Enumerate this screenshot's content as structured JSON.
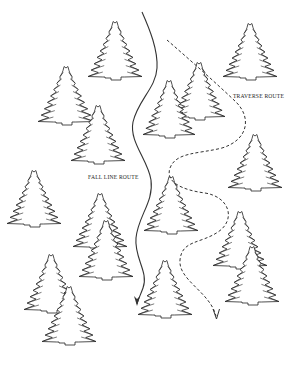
{
  "labels": {
    "fall_line": {
      "text": "FALL LINE ROUTE",
      "x": 88,
      "y": 174
    },
    "traverse": {
      "text": "TRAVERSE ROUTE",
      "x": 233,
      "y": 93
    }
  },
  "colors": {
    "ink": "#222222",
    "background": "#ffffff",
    "tree_fill": "#ffffff"
  },
  "routes": {
    "fall_line": {
      "name": "Fall Line Route",
      "style": "solid",
      "path": "M142,12 C150,30 158,50 157,68 C156,88 138,100 133,122 C129,142 148,160 151,180 C154,202 138,216 136,238 C134,258 149,272 143,288 C140,296 138,300 137,304"
    },
    "traverse": {
      "name": "Traverse Route",
      "style": "dashed",
      "path": "M167,40 C190,60 215,82 236,102 C252,118 248,140 222,148 C198,154 176,152 170,168 C165,182 182,190 205,193 C230,197 236,220 218,232 C200,244 182,240 180,260 C178,280 210,292 216,316"
    }
  },
  "trees": [
    {
      "x": 115,
      "y": 23,
      "h": 57,
      "w": 27
    },
    {
      "x": 250,
      "y": 25,
      "h": 55,
      "w": 27
    },
    {
      "x": 66,
      "y": 68,
      "h": 57,
      "w": 28
    },
    {
      "x": 199,
      "y": 64,
      "h": 56,
      "w": 26
    },
    {
      "x": 169,
      "y": 82,
      "h": 56,
      "w": 26
    },
    {
      "x": 98,
      "y": 107,
      "h": 57,
      "w": 27
    },
    {
      "x": 255,
      "y": 136,
      "h": 55,
      "w": 27
    },
    {
      "x": 34,
      "y": 172,
      "h": 55,
      "w": 27
    },
    {
      "x": 171,
      "y": 178,
      "h": 56,
      "w": 27
    },
    {
      "x": 100,
      "y": 195,
      "h": 55,
      "w": 27
    },
    {
      "x": 240,
      "y": 213,
      "h": 56,
      "w": 27
    },
    {
      "x": 106,
      "y": 222,
      "h": 58,
      "w": 27
    },
    {
      "x": 252,
      "y": 248,
      "h": 57,
      "w": 27
    },
    {
      "x": 51,
      "y": 256,
      "h": 57,
      "w": 27
    },
    {
      "x": 165,
      "y": 262,
      "h": 56,
      "w": 27
    },
    {
      "x": 69,
      "y": 288,
      "h": 57,
      "w": 27
    }
  ],
  "icons": {
    "tree": "evergreen-tree-icon",
    "arrow": "arrowhead-down-icon"
  }
}
